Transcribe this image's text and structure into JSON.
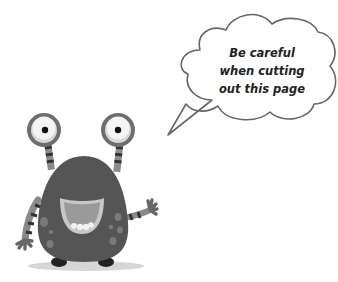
{
  "illustration": {
    "subject": "monster-character",
    "colors": {
      "body": "#555555",
      "body_spots": "#7a7a7a",
      "eye_ring": "#6e6e6e",
      "eye_white": "#f4f4f4",
      "pupil": "#111111",
      "mouth": "#9a9a9a",
      "mouth_rim": "#c8c8c8",
      "teeth": "#f2f2f2",
      "stripe_light": "#8a8a8a",
      "stripe_dark": "#333333",
      "feet": "#222222",
      "shadow": "#d6d6d6",
      "bubble_outline": "#666666"
    }
  },
  "speech_bubble": {
    "lines": [
      "Be careful",
      "when cutting",
      "out this page"
    ]
  }
}
